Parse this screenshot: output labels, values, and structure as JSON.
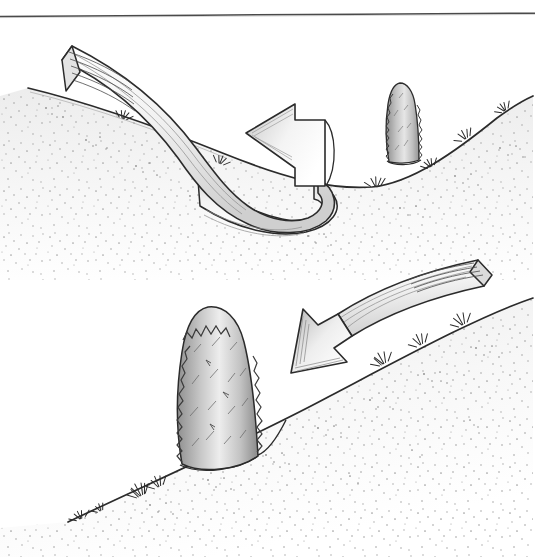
{
  "document": {
    "type": "line-illustration",
    "medium": "pen-and-ink drawing",
    "title": "Wind flow over hillside with shrub windbreak",
    "background_color": "#ffffff",
    "ink_color": "#2b2b2b",
    "width": 535,
    "height": 557
  },
  "rule": {
    "name": "top-horizontal-rule",
    "color": "#4a4a4a",
    "y_left": 16,
    "y_right": 13,
    "thickness": 1.4
  },
  "panels": [
    {
      "id": "upper",
      "label": "Upper scene: valley with single shrub on far slope",
      "description": "A wide ribbon arrow sweeps down the left slope into the valley, curls back on itself and points left, showing recirculating wind in the hollow.",
      "ground": {
        "name": "hillside-profile-upper",
        "shape": "valley",
        "low_point_x": 372,
        "low_point_y": 187,
        "left_crest": {
          "x": 28,
          "y": 88
        },
        "right_crest": {
          "x": 533,
          "y": 96
        }
      },
      "shrub": {
        "name": "shrub-upper",
        "kind": "columnar evergreen",
        "base_x": 398,
        "base_y": 160,
        "top_y": 84,
        "width": 28,
        "fill": "#b9b9b9"
      },
      "arrow": {
        "name": "wind-arrow-upper",
        "style": "ribbon",
        "direction": "down-slope then recirculating back uphill",
        "head_points": "left",
        "head_x": 246,
        "head_y": 133,
        "tail_x": 70,
        "tail_y": 44,
        "fill": "#ededed",
        "stroke": "#2b2b2b"
      },
      "grass_tufts": 7,
      "stipple_label": "soil stipple texture"
    },
    {
      "id": "lower",
      "label": "Lower scene: tall shrub windbreak on rising slope",
      "description": "A straight ribbon arrow sweeps down the slope from upper right and its head stops just above the tall shrub, showing the windbreak deflecting the flow.",
      "ground": {
        "name": "hillside-profile-lower",
        "shape": "rising slope",
        "bottom_left": {
          "x": 68,
          "y": 522
        },
        "top_right": {
          "x": 533,
          "y": 298
        }
      },
      "shrub": {
        "name": "shrub-lower",
        "kind": "columnar evergreen",
        "base_x": 205,
        "base_y": 458,
        "top_y": 308,
        "width": 60,
        "fill": "#c2c2c2"
      },
      "arrow": {
        "name": "wind-arrow-lower",
        "style": "ribbon",
        "direction": "down-slope toward shrub",
        "head_points": "down-left",
        "head_x": 291,
        "head_y": 355,
        "tail_x": 478,
        "tail_y": 262,
        "fill": "#f0f0f0",
        "stroke": "#2b2b2b"
      },
      "grass_tufts": 6,
      "stipple_label": "soil stipple texture"
    }
  ],
  "palette": {
    "ink": "#2b2b2b",
    "ink_light": "#6e6e6e",
    "ribbon_fill": "#efefef",
    "ribbon_shade": "#cfcfcf",
    "shrub_fill": "#bdbdbd",
    "shrub_highlight": "#e2e2e2",
    "stipple": "#7a7a7a",
    "rule": "#4a4a4a",
    "paper": "#ffffff"
  }
}
